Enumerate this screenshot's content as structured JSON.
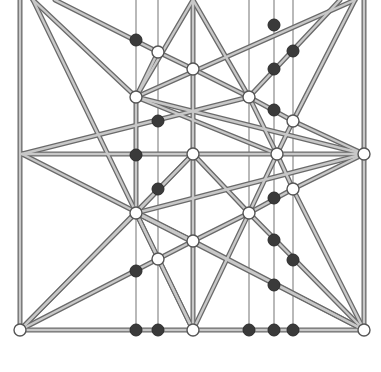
{
  "board": {
    "width": 381,
    "height": 372,
    "colors": {
      "edge_outline": "#6a6a6a",
      "edge_fill": "#c8c8c8",
      "guide_line": "#8a8a8a",
      "white_node_fill": "#ffffff",
      "white_node_stroke": "#555555",
      "black_node_fill": "#3a3a3a",
      "background": "#ffffff"
    },
    "guide_lines_x": [
      136,
      158,
      249,
      274,
      293
    ],
    "guide_top": 0,
    "guide_bottom": 330,
    "edges": [
      [
        20,
        0,
        20,
        330
      ],
      [
        364,
        0,
        364,
        330
      ],
      [
        20,
        330,
        364,
        330
      ],
      [
        22,
        154,
        364,
        154
      ],
      [
        33,
        0,
        193,
        330
      ],
      [
        33,
        0,
        136,
        97
      ],
      [
        55,
        0,
        158,
        52
      ],
      [
        158,
        52,
        193,
        69
      ],
      [
        193,
        69,
        249,
        97
      ],
      [
        193,
        0,
        136,
        97
      ],
      [
        193,
        0,
        193,
        330
      ],
      [
        193,
        0,
        249,
        97
      ],
      [
        355,
        0,
        136,
        97
      ],
      [
        340,
        0,
        249,
        97
      ],
      [
        355,
        0,
        293,
        121
      ],
      [
        136,
        97,
        364,
        154
      ],
      [
        249,
        97,
        22,
        154
      ],
      [
        158,
        52,
        136,
        97
      ],
      [
        136,
        97,
        277,
        154
      ],
      [
        249,
        97,
        277,
        154
      ],
      [
        293,
        121,
        364,
        154
      ],
      [
        277,
        154,
        293,
        121
      ],
      [
        22,
        154,
        193,
        241
      ],
      [
        364,
        154,
        136,
        213
      ],
      [
        136,
        213,
        193,
        154
      ],
      [
        193,
        154,
        249,
        213
      ],
      [
        136,
        97,
        136,
        213
      ],
      [
        136,
        213,
        193,
        241
      ],
      [
        193,
        241,
        249,
        213
      ],
      [
        277,
        154,
        249,
        213
      ],
      [
        277,
        154,
        293,
        189
      ],
      [
        293,
        189,
        364,
        154
      ],
      [
        249,
        213,
        293,
        189
      ],
      [
        136,
        213,
        193,
        330
      ],
      [
        249,
        213,
        193,
        330
      ],
      [
        193,
        241,
        158,
        259
      ],
      [
        158,
        259,
        20,
        330
      ],
      [
        20,
        330,
        136,
        213
      ],
      [
        20,
        330,
        193,
        154
      ],
      [
        249,
        213,
        364,
        330
      ],
      [
        136,
        213,
        364,
        330
      ],
      [
        293,
        189,
        364,
        330
      ],
      [
        193,
        241,
        364,
        330
      ],
      [
        249,
        97,
        293,
        121
      ]
    ],
    "white_nodes": [
      {
        "x": 20,
        "y": 330
      },
      {
        "x": 364,
        "y": 330
      },
      {
        "x": 364,
        "y": 154
      },
      {
        "x": 193,
        "y": 330
      },
      {
        "x": 158,
        "y": 52
      },
      {
        "x": 136,
        "y": 97
      },
      {
        "x": 193,
        "y": 69
      },
      {
        "x": 249,
        "y": 97
      },
      {
        "x": 293,
        "y": 121
      },
      {
        "x": 193,
        "y": 154
      },
      {
        "x": 277,
        "y": 154
      },
      {
        "x": 136,
        "y": 213
      },
      {
        "x": 249,
        "y": 213
      },
      {
        "x": 193,
        "y": 241
      },
      {
        "x": 293,
        "y": 189
      },
      {
        "x": 158,
        "y": 259
      }
    ],
    "black_nodes": [
      {
        "x": 136,
        "y": 40
      },
      {
        "x": 274,
        "y": 25
      },
      {
        "x": 293,
        "y": 51
      },
      {
        "x": 274,
        "y": 69
      },
      {
        "x": 274,
        "y": 110
      },
      {
        "x": 158,
        "y": 121
      },
      {
        "x": 136,
        "y": 155
      },
      {
        "x": 158,
        "y": 189
      },
      {
        "x": 274,
        "y": 198
      },
      {
        "x": 274,
        "y": 240
      },
      {
        "x": 293,
        "y": 260
      },
      {
        "x": 136,
        "y": 271
      },
      {
        "x": 274,
        "y": 285
      },
      {
        "x": 136,
        "y": 330
      },
      {
        "x": 158,
        "y": 330
      },
      {
        "x": 249,
        "y": 330
      },
      {
        "x": 274,
        "y": 330
      },
      {
        "x": 293,
        "y": 330
      }
    ],
    "node_radius_white": 6,
    "node_radius_black": 6
  }
}
